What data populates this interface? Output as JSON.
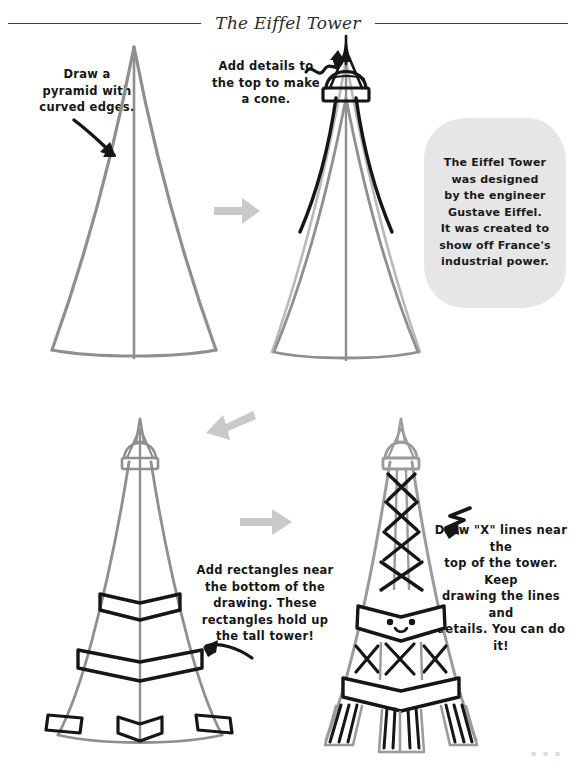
{
  "page": {
    "title": "The Eiffel Tower",
    "background_color": "#ffffff",
    "width": 576,
    "height": 770,
    "corner_mark": "▪ ▪ ▪"
  },
  "colors": {
    "ink_black": "#161616",
    "guide_gray": "#8f8f8f",
    "arrow_gray": "#c9c9c9",
    "fact_box_gray": "#e6e6e6",
    "title_rule": "#3b3b3b"
  },
  "steps": [
    {
      "number": 1,
      "instruction": "Draw a\npyramid with\ncurved edges.",
      "drawing_name": "pyramid-outline",
      "drawing_color": "guide_gray",
      "pointer_icon": "curved-arrow-down-right"
    },
    {
      "number": 2,
      "instruction": "Add details to\nthe top to make\na cone.",
      "drawing_name": "tower-with-cone-top",
      "drawing_color": "ink_black",
      "pointer_icon": "squiggle-arrow-up-right"
    },
    {
      "number": 3,
      "instruction": "Add rectangles near\nthe bottom of the\ndrawing. These\nrectangles hold up\nthe tall tower!",
      "drawing_name": "tower-with-platform-rectangles",
      "drawing_color": "ink_black",
      "pointer_icon": "curved-arrow-left"
    },
    {
      "number": 4,
      "instruction": "Draw \"X\" lines near the\ntop of the tower. Keep\ndrawing the lines and\ndetails. You can do it!",
      "drawing_name": "finished-eiffel-tower",
      "drawing_color": "ink_black",
      "pointer_icon": "zigzag-arrow-left"
    }
  ],
  "fact_box": {
    "text": "The Eiffel Tower\nwas designed\nby the engineer\nGustave Eiffel.\nIt was created to\nshow off France's\nindustrial power."
  },
  "flow_arrows": [
    {
      "name": "step-arrow-1-to-2",
      "direction": "right"
    },
    {
      "name": "step-arrow-2-to-3",
      "direction": "down-left"
    },
    {
      "name": "step-arrow-3-to-4",
      "direction": "right"
    }
  ],
  "tower_features": {
    "spire": "black filled needle spire",
    "dome": "rounded cone dome under spire",
    "observation_band": "horizontal rectangular band",
    "lattice": "X cross-brace lines",
    "platforms": "two chevron platform bands",
    "feet": "four base rectangles",
    "face": "kawaii face with two dot eyes and a smile"
  }
}
